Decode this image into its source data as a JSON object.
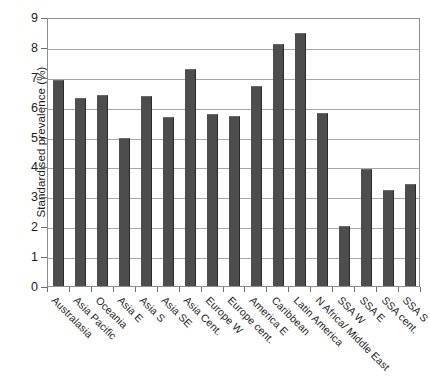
{
  "chart_data": {
    "type": "bar",
    "title": "",
    "xlabel": "",
    "ylabel": "Standardised prevalence (%)",
    "ylim": [
      0,
      9
    ],
    "ytick_labels": [
      "0",
      "1",
      "2",
      "3",
      "4",
      "5",
      "6",
      "7",
      "8",
      "9"
    ],
    "yticks": [
      0,
      1,
      2,
      3,
      4,
      5,
      6,
      7,
      8,
      9
    ],
    "grid": true,
    "legend": false,
    "bar_color": "#4d4d4d",
    "categories": [
      "Australasia",
      "Asia Pacific",
      "Oceania",
      "Asia E",
      "Asia S",
      "Asia SE",
      "Asia Cent.",
      "Europe W",
      "Europe cent.",
      "America E",
      "Caribbean",
      "Latin America",
      "N Africa/ Middle East",
      "SSA W",
      "SSA E",
      "SSA cent.",
      "SSA S"
    ],
    "values": [
      6.9,
      6.3,
      6.4,
      4.95,
      6.35,
      5.65,
      7.25,
      5.75,
      5.7,
      6.7,
      8.1,
      8.45,
      5.8,
      2.0,
      3.9,
      3.2,
      3.4
    ]
  }
}
